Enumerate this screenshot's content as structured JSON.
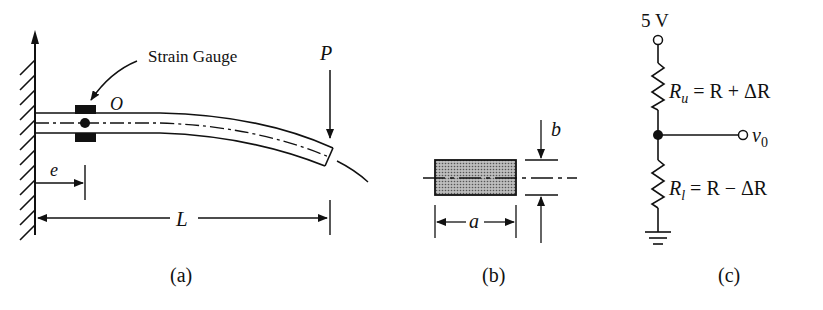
{
  "figure_a": {
    "caption": "(a)",
    "strain_gauge_label": "Strain Gauge",
    "point_label": "O",
    "load_label": "P",
    "offset_label": "e",
    "length_label": "L"
  },
  "figure_b": {
    "caption": "(b)",
    "width_label": "a",
    "thickness_label": "b"
  },
  "figure_c": {
    "caption": "(c)",
    "supply_label": "5 V",
    "upper_resistor_label": "R_u = R + ΔR",
    "lower_resistor_label": "R_l = R − ΔR",
    "output_label": "v0",
    "upper_R": "R",
    "upper_sub": "u",
    "upper_eq": " = R + ΔR",
    "lower_R": "R",
    "lower_sub": "l",
    "lower_eq": " = R − ΔR",
    "out_v": "v",
    "out_sub": "0"
  },
  "colors": {
    "ink": "#111111",
    "fill_gray": "#9a9a9a",
    "background": "#ffffff"
  }
}
